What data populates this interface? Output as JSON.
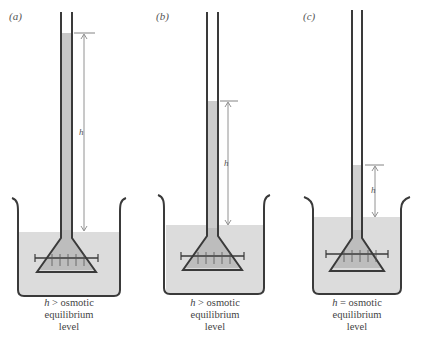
{
  "figure": {
    "panels": [
      {
        "label": "(a)",
        "h_label": "h",
        "caption_line1_var": "h",
        "caption_line1_rest": " > osmotic",
        "caption_line2": "equilibrium",
        "caption_line3": "level",
        "column_top_y": 33,
        "water_level_y": 232
      },
      {
        "label": "(b)",
        "h_label": "h",
        "caption_line1_var": "h",
        "caption_line1_rest": " > osmotic",
        "caption_line2": "equilibrium",
        "caption_line3": "level",
        "column_top_y": 101,
        "water_level_y": 225
      },
      {
        "label": "(c)",
        "h_label": "h",
        "caption_line1_var": "h",
        "caption_line1_rest": " = osmotic",
        "caption_line2": "equilibrium",
        "caption_line3": "level",
        "column_top_y": 165,
        "water_level_y": 217
      }
    ],
    "colors": {
      "glass": "#3a3a3a",
      "liquid": "#d9d9d9",
      "solution": "#bdbdbd",
      "arrow": "#777777"
    }
  }
}
